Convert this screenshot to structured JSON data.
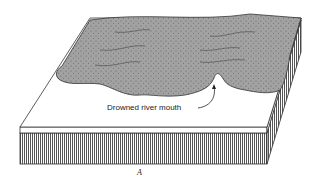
{
  "diagram": {
    "type": "block-diagram",
    "annotation": "Drowned river mouth",
    "figure_label": "A",
    "colors": {
      "land": "#9a9a9a",
      "sea": "#ffffff",
      "line": "#333333"
    }
  }
}
